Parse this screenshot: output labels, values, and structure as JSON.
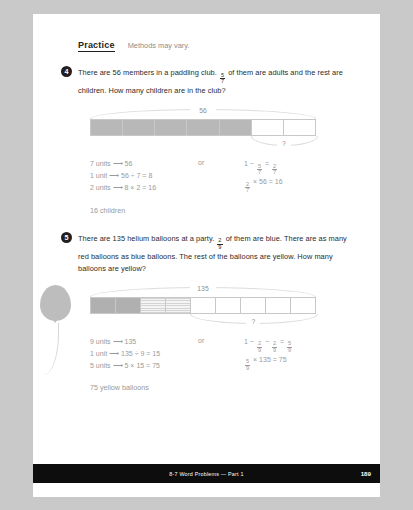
{
  "header": {
    "title": "Practice",
    "note": "Methods may vary."
  },
  "questions": [
    {
      "number": "4",
      "text_a": "There are 56 members in a paddling club. ",
      "fraction": {
        "n": "5",
        "d": "7"
      },
      "text_b": " of them are adults and the rest are children. How many children are in the club?",
      "model": {
        "total_label": "56",
        "unknown_label": "?",
        "units": 7,
        "cells": [
          "shade",
          "shade",
          "shade",
          "shade",
          "shade",
          "plain",
          "plain"
        ],
        "unknown_start_pct": 71.4,
        "unknown_width_pct": 28.6
      },
      "work_left": [
        "7 units ⟶ 56",
        "1 unit ⟶ 56 ÷ 7 = 8",
        "2 units ⟶ 8 × 2 = 16"
      ],
      "or_label": "or",
      "work_right": [
        {
          "parts": [
            {
              "t": "1 − "
            },
            {
              "f": {
                "n": "5",
                "d": "7"
              }
            },
            {
              "t": " = "
            },
            {
              "f": {
                "n": "2",
                "d": "7"
              }
            }
          ]
        },
        {
          "parts": [
            {
              "f": {
                "n": "2",
                "d": "7"
              }
            },
            {
              "t": " × 56 = 16"
            }
          ]
        }
      ],
      "answer": "16 children"
    },
    {
      "number": "5",
      "text_a": "There are 135 helium balloons at a party. ",
      "fraction": {
        "n": "2",
        "d": "9"
      },
      "text_b": " of them are blue. There are as many red balloons as blue balloons. The rest of the balloons are yellow. How many balloons are yellow?",
      "model": {
        "total_label": "135",
        "unknown_label": "?",
        "units": 9,
        "cells": [
          "dark",
          "dark",
          "stripe",
          "stripe",
          "plain",
          "plain",
          "plain",
          "plain",
          "plain"
        ],
        "unknown_start_pct": 44.4,
        "unknown_width_pct": 55.6
      },
      "work_left": [
        "9 units ⟶ 135",
        "1 unit ⟶ 135 ÷ 9 = 15",
        "5 units ⟶ 5 × 15 = 75"
      ],
      "or_label": "or",
      "work_right": [
        {
          "parts": [
            {
              "t": "1 − "
            },
            {
              "f": {
                "n": "2",
                "d": "9"
              }
            },
            {
              "t": " − "
            },
            {
              "f": {
                "n": "2",
                "d": "9"
              }
            },
            {
              "t": " = "
            },
            {
              "f": {
                "n": "5",
                "d": "9"
              }
            }
          ]
        },
        {
          "parts": [
            {
              "f": {
                "n": "5",
                "d": "9"
              }
            },
            {
              "t": " × 135 = 75"
            }
          ]
        }
      ],
      "answer": "75 yellow balloons"
    }
  ],
  "footer": {
    "text": "8-7  Word Problems — Part 1",
    "page": "189"
  },
  "colors": {
    "page_bg": "#ffffff",
    "outer_bg": "#c9c9c9",
    "ink": "#2b2b2b",
    "muted": "#9a9a9a",
    "bar_shade": "#b8b8b8",
    "footer_bg": "#0d0d0d"
  }
}
